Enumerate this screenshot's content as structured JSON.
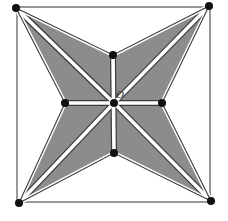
{
  "diagram": {
    "width": 228,
    "height": 221,
    "colors": {
      "background": "#ffffff",
      "shade": "#8c8c8c",
      "line": "#3a3a3a",
      "dot": "#111111",
      "gap": "#ffffff"
    },
    "square": {
      "x": 17,
      "y": 7,
      "w": 193,
      "h": 195
    },
    "points": {
      "A": {
        "x": 16,
        "y": 8
      },
      "B": {
        "x": 209,
        "y": 6
      },
      "C": {
        "x": 211,
        "y": 201
      },
      "D": {
        "x": 19,
        "y": 203
      },
      "top": {
        "x": 113,
        "y": 55
      },
      "right": {
        "x": 162,
        "y": 103
      },
      "bottom": {
        "x": 114,
        "y": 153
      },
      "left": {
        "x": 65,
        "y": 103
      },
      "O": {
        "x": 114,
        "y": 103
      }
    },
    "center_label": "O"
  }
}
